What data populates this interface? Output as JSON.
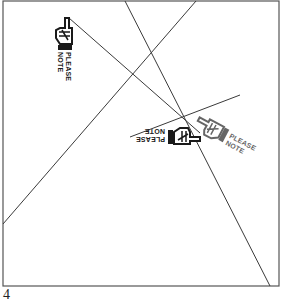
{
  "figure": {
    "page_number": "4",
    "frame": {
      "x1": 3,
      "y1": 1,
      "x2": 279,
      "y2": 286,
      "stroke": "#555555"
    },
    "lines": [
      {
        "id": "line-a",
        "x1": 125,
        "y1": 1,
        "x2": 270,
        "y2": 286
      },
      {
        "id": "line-b",
        "x1": 196,
        "y1": 1,
        "x2": 3,
        "y2": 224
      },
      {
        "id": "line-c",
        "x1": 69,
        "y1": 18,
        "x2": 200,
        "y2": 133
      },
      {
        "id": "line-d",
        "x1": 130,
        "y1": 137,
        "x2": 240,
        "y2": 95
      }
    ],
    "line_color": "#3a3a3a",
    "hands": [
      {
        "id": "hand-top-left",
        "label_line1": "PLEASE",
        "label_line2": "NOTE",
        "x": 62,
        "y": 18,
        "rotation": 0,
        "color": "#1a1a1a"
      },
      {
        "id": "hand-middle-right",
        "label_line1": "PLEASE",
        "label_line2": "NOTE",
        "x": 210,
        "y": 120,
        "rotation": -62,
        "color": "#555555"
      },
      {
        "id": "hand-middle-left",
        "label_line1": "PLEASE",
        "label_line2": "NOTE",
        "x": 168,
        "y": 140,
        "rotation": 180,
        "color": "#1a1a1a"
      }
    ]
  }
}
